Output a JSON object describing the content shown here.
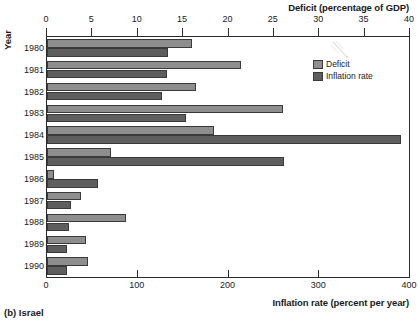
{
  "caption": "(b) Israel",
  "legend": {
    "position": "top-right",
    "items": [
      {
        "label": "Deficit",
        "color": "#8e8e8e",
        "swatch": "deficit-swatch"
      },
      {
        "label": "Inflation rate",
        "color": "#5e5e5e",
        "swatch": "inflation-swatch"
      }
    ]
  },
  "axes": {
    "y_title": "Year",
    "top_title": "Deficit (percentage of GDP)",
    "bottom_title": "Inflation rate (percent per year)",
    "top_ticks": [
      "0",
      "5",
      "10",
      "15",
      "20",
      "25",
      "30",
      "35",
      "40"
    ],
    "bottom_ticks": [
      "0",
      "100",
      "200",
      "300",
      "400"
    ]
  },
  "chart_data": {
    "type": "bar",
    "orientation": "horizontal",
    "title": "",
    "subtitle": "(b) Israel",
    "categories": [
      "1980",
      "1981",
      "1982",
      "1983",
      "1984",
      "1985",
      "1986",
      "1987",
      "1988",
      "1989",
      "1990"
    ],
    "ylabel": "Year",
    "grid": false,
    "legend_position": "top-right",
    "series": [
      {
        "name": "Deficit",
        "color": "#8e8e8e",
        "axis": "top",
        "axis_label": "Deficit (percentage of GDP)",
        "xlim": [
          0,
          40
        ],
        "values": [
          16.0,
          21.4,
          16.4,
          26.0,
          18.4,
          7.0,
          0.8,
          3.7,
          8.7,
          4.3,
          4.5
        ]
      },
      {
        "name": "Inflation rate",
        "color": "#5e5e5e",
        "axis": "bottom",
        "axis_label": "Inflation rate (percent per year)",
        "xlim": [
          0,
          400
        ],
        "values": [
          133,
          132,
          127,
          153,
          390,
          261,
          56,
          26,
          24,
          22,
          22
        ]
      }
    ]
  }
}
